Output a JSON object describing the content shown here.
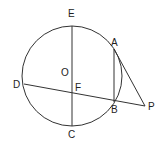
{
  "diagram": {
    "type": "geometry",
    "circle": {
      "center_label": "O",
      "cx": 72,
      "cy": 76,
      "r": 50
    },
    "points": {
      "E": {
        "label": "E",
        "x": 72,
        "y": 26
      },
      "C": {
        "label": "C",
        "x": 72,
        "y": 126
      },
      "A": {
        "label": "A",
        "x": 114,
        "y": 49
      },
      "B": {
        "label": "B",
        "x": 114,
        "y": 102
      },
      "D": {
        "label": "D",
        "x": 24,
        "y": 84
      },
      "F": {
        "label": "F",
        "x": 72,
        "y": 93
      },
      "P": {
        "label": "P",
        "x": 145,
        "y": 106
      },
      "O": {
        "label": "O",
        "x": 72,
        "y": 76
      }
    },
    "segments": [
      "EC",
      "DP",
      "AB",
      "AP"
    ],
    "colors": {
      "stroke": "#333333",
      "text": "#222222",
      "background": "#ffffff"
    }
  }
}
